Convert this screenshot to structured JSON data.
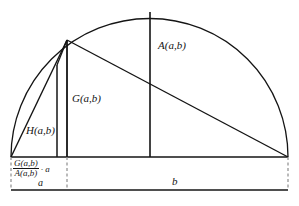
{
  "figure": {
    "labels": {
      "arithmetic_mean": "A(a,b)",
      "geometric_mean": "G(a,b)",
      "harmonic_mean": "H(a,b)",
      "segment_a": "a",
      "segment_b": "b",
      "ratio_numerator": "G(a,b)",
      "ratio_denominator": "A(a,b)",
      "ratio_multiplier": "· a"
    },
    "colors": {
      "stroke": "#141414",
      "dashed": "#8d8d8d",
      "background": "#ffffff"
    },
    "geometry": {
      "baseline_y": 157,
      "left_x": 11,
      "right_x": 288,
      "split_x": 67,
      "center_x": 150,
      "apex_y": 12,
      "radius": 139,
      "g_top_y": 40,
      "h_x": 57,
      "h_top_y": 65,
      "bottom_rule_y": 190
    }
  }
}
